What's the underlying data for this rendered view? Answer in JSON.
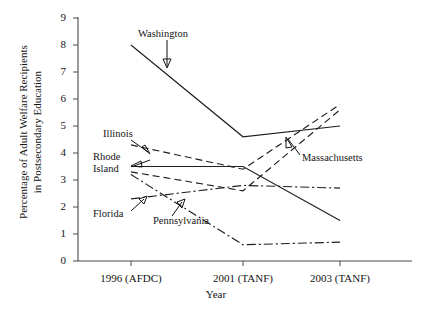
{
  "chart_data": {
    "type": "line",
    "title": "",
    "xlabel": "Year",
    "ylabel": "Percentage of Adult Welfare Recipients in Postsecondary Education",
    "ylabel_line1": "Percentage of Adult Welfare Recipients",
    "ylabel_line2": "in Postsecondary Education",
    "categories": [
      "1996 (AFDC)",
      "2001 (TANF)",
      "2003 (TANF)"
    ],
    "x_tick_labels": [
      "1996 (AFDC)",
      "2001 (TANF)",
      "2003 (TANF)"
    ],
    "y_tick_labels": [
      "0",
      "1",
      "2",
      "3",
      "4",
      "5",
      "6",
      "7",
      "8",
      "9"
    ],
    "ylim": [
      0,
      9
    ],
    "ytick_values": [
      0,
      1,
      2,
      3,
      4,
      5,
      6,
      7,
      8,
      9
    ],
    "grid": false,
    "legend": "inline-annotations",
    "legend_position": "inline",
    "series": [
      {
        "name": "Washington",
        "values": [
          8.0,
          4.6,
          5.0
        ],
        "style": "solid",
        "label": "Washington"
      },
      {
        "name": "Illinois",
        "values": [
          4.3,
          3.4,
          5.8
        ],
        "style": "dashed",
        "label": "Illinois"
      },
      {
        "name": "Rhode Island",
        "values": [
          3.5,
          3.5,
          1.5
        ],
        "style": "solid",
        "label": "Rhode Island",
        "label_line1": "Rhode",
        "label_line2": "Island"
      },
      {
        "name": "Massachusetts",
        "values": [
          3.3,
          2.6,
          5.6
        ],
        "style": "dashed",
        "label": "Massachusetts"
      },
      {
        "name": "Florida",
        "values": [
          2.3,
          2.8,
          2.7
        ],
        "style": "dash-dot",
        "label": "Florida"
      },
      {
        "name": "Pennsylvania",
        "values": [
          3.2,
          0.6,
          0.7
        ],
        "style": "dash-dot",
        "label": "Pennsylvania"
      }
    ],
    "annotations": [
      {
        "text": "Washington",
        "target_series": "Washington"
      },
      {
        "text": "Illinois",
        "target_series": "Illinois"
      },
      {
        "text": "Rhode Island",
        "target_series": "Rhode Island"
      },
      {
        "text": "Massachusetts",
        "target_series": "Massachusetts"
      },
      {
        "text": "Florida",
        "target_series": "Florida"
      },
      {
        "text": "Pennsylvania",
        "target_series": "Pennsylvania"
      }
    ],
    "colors": {
      "line": "#1f1f1f",
      "axis": "#4a4a4a",
      "background": "#ffffff",
      "text": "#141414"
    }
  }
}
